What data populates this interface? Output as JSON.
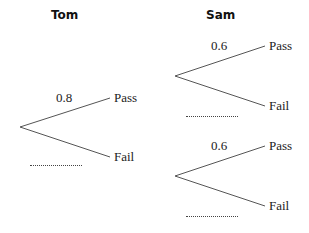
{
  "titles": {
    "tom": "Tom",
    "sam": "Sam"
  },
  "tom_tree": {
    "prob_pass": "0.8",
    "pass_label": "Pass",
    "fail_label": "Fail",
    "blank_prob": "..............."
  },
  "sam_tree_top": {
    "prob_pass": "0.6",
    "pass_label": "Pass",
    "fail_label": "Fail",
    "blank_prob": "..............."
  },
  "sam_tree_bottom": {
    "prob_pass": "0.6",
    "pass_label": "Pass",
    "fail_label": "Fail",
    "blank_prob": "..............."
  },
  "colors": {
    "line": "#555555",
    "text": "#222222"
  }
}
